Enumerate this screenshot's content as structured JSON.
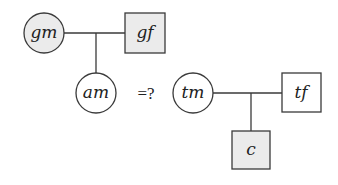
{
  "diagram": {
    "type": "pedigree",
    "colors": {
      "stroke": "#3a3a3a",
      "shaded": "#ebebeb",
      "unshaded": "#ffffff"
    },
    "left_family": {
      "grandmother": {
        "label": "gm",
        "shape": "circle",
        "shaded": true
      },
      "grandfather": {
        "label": "gf",
        "shape": "square",
        "shaded": true
      },
      "child": {
        "label": "am",
        "shape": "circle",
        "shaded": false
      }
    },
    "relation": {
      "label": "=?"
    },
    "right_family": {
      "mother": {
        "label": "tm",
        "shape": "circle",
        "shaded": false
      },
      "father": {
        "label": "tf",
        "shape": "square",
        "shaded": false
      },
      "child": {
        "label": "c",
        "shape": "square",
        "shaded": true
      }
    }
  }
}
